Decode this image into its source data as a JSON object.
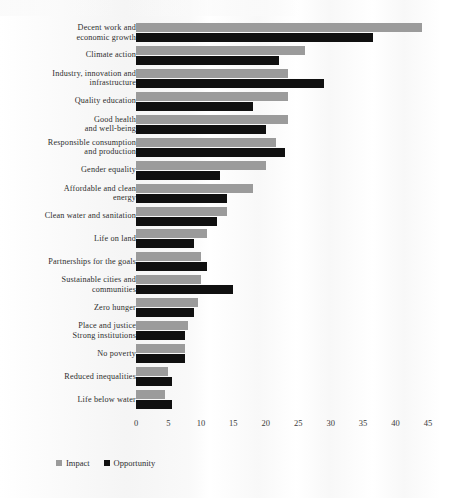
{
  "chart_data": {
    "type": "bar",
    "orientation": "horizontal",
    "title": "",
    "subtitle": "",
    "xlabel": "",
    "ylabel": "",
    "xlim": [
      0,
      45
    ],
    "xticks": [
      0,
      5,
      10,
      15,
      20,
      25,
      30,
      35,
      40,
      45
    ],
    "grid": false,
    "legend_position": "bottom-left",
    "categories": [
      "Decent work and economic growth",
      "Climate action",
      "Industry, innovation and infrastructure",
      "Quality education",
      "Good health and well-being",
      "Responsible consumption and production",
      "Gender equality",
      "Affordable and clean energy",
      "Clean water and sanitation",
      "Life on land",
      "Partnerships for the goals",
      "Sustainable cities and communities",
      "Zero hunger",
      "Place and justice Strong institutions",
      "No poverty",
      "Reduced inequalities",
      "Life below water"
    ],
    "category_lines": [
      [
        "Decent work and",
        "economic growth"
      ],
      [
        "Climate action"
      ],
      [
        "Industry, innovation and",
        "infrastructure"
      ],
      [
        "Quality education"
      ],
      [
        "Good health",
        "and well-being"
      ],
      [
        "Responsible consumption",
        "and production"
      ],
      [
        "Gender equality"
      ],
      [
        "Affordable and clean",
        "energy"
      ],
      [
        "Clean water and sanitation"
      ],
      [
        "Life on land"
      ],
      [
        "Partnerships for the goals"
      ],
      [
        "Sustainable cities and",
        "communities"
      ],
      [
        "Zero hunger"
      ],
      [
        "Place and justice",
        "Strong institutions"
      ],
      [
        "No poverty"
      ],
      [
        "Reduced inequalities"
      ],
      [
        "Life below water"
      ]
    ],
    "series": [
      {
        "name": "Impact",
        "color": "#9b9b9b",
        "values": [
          44,
          26,
          23.5,
          23.5,
          23.5,
          21.5,
          20,
          18,
          14,
          11,
          10,
          10,
          9.5,
          8,
          7.5,
          5,
          4.5
        ]
      },
      {
        "name": "Opportunity",
        "color": "#101010",
        "values": [
          36.5,
          22,
          29,
          18,
          20,
          23,
          13,
          14,
          12.5,
          9,
          11,
          15,
          9,
          7.5,
          7.5,
          5.5,
          5.5
        ]
      }
    ]
  },
  "legend": {
    "items": [
      {
        "label": "Impact",
        "color": "#9b9b9b"
      },
      {
        "label": "Opportunity",
        "color": "#101010"
      }
    ]
  }
}
